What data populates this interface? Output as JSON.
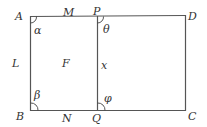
{
  "diagram": {
    "type": "geometry",
    "colors": {
      "stroke": "#555555",
      "text": "#333333",
      "background": "#ffffff"
    },
    "vertices": {
      "A": "A",
      "B": "B",
      "C": "C",
      "D": "D",
      "P": "P",
      "Q": "Q"
    },
    "side_labels": {
      "M": "M",
      "N": "N",
      "L": "L",
      "x": "x"
    },
    "region_label": "F",
    "angles": {
      "alpha": "α",
      "beta": "β",
      "theta": "θ",
      "phi": "φ"
    }
  }
}
